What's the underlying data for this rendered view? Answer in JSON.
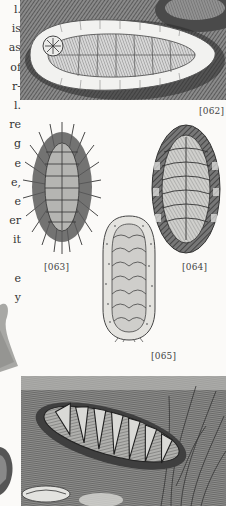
{
  "page": {
    "type": "book-page-scan",
    "background": "#fbfaf8",
    "ink": "#2a2a2a"
  },
  "text_column": {
    "lines": [
      "l.",
      "is",
      "as",
      "of",
      "r-",
      "l.",
      "re",
      "g",
      "e",
      "e,",
      "e",
      "er",
      "it",
      "",
      "e",
      "y"
    ]
  },
  "figures": [
    {
      "id": "062",
      "label": "[062]",
      "description": "chiton with wide pale girdle on rock"
    },
    {
      "id": "063",
      "label": "[063]",
      "description": "spiny bristled chiton"
    },
    {
      "id": "064",
      "label": "[064]",
      "description": "banded-girdle chiton"
    },
    {
      "id": "065",
      "label": "[065]",
      "description": "elongated granular chiton"
    },
    {
      "id": "066",
      "label": "",
      "description": "chiton among seaweed on rock"
    }
  ]
}
